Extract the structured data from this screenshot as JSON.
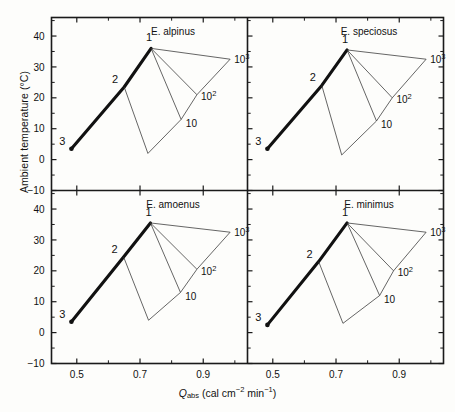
{
  "figure": {
    "axis": {
      "ylabel": "Ambient temperature (°C)",
      "xlabel_symbol": "Q",
      "xlabel_sub": "abs",
      "xlabel_units_pre": " (cal cm",
      "xlabel_units_sup1": "−2",
      "xlabel_units_mid": " min",
      "xlabel_units_sup2": "−1",
      "xlabel_units_post": ")",
      "xlabel_full": "Qabs (cal cm−2 min−1)",
      "yticks": [
        "40",
        "30",
        "20",
        "10",
        "0",
        "−10"
      ],
      "ytick_values": [
        40,
        30,
        20,
        10,
        0,
        -10
      ],
      "xticks": [
        "0.5",
        "0.7",
        "0.9"
      ],
      "xtick_values": [
        0.5,
        0.7,
        0.9
      ],
      "ylim": [
        -10,
        46
      ],
      "xlim": [
        0.42,
        1.04
      ],
      "grid": false
    },
    "panels": [
      {
        "key": "alpinus",
        "title": "E. alpinus"
      },
      {
        "key": "speciosus",
        "title": "E. speciosus"
      },
      {
        "key": "amoenus",
        "title": "E. amoenus"
      },
      {
        "key": "minimus",
        "title": "E. minimus"
      }
    ],
    "node_labels": {
      "one": "1",
      "two": "2",
      "three": "3"
    },
    "wind_labels": {
      "low": "10",
      "mid_base": "10",
      "mid_exp": "2",
      "high_base": "10",
      "high_exp": "3"
    },
    "colors": {
      "ink": "#111111",
      "frame": "#1a1a1a",
      "thin": "#333333",
      "background": "#fdfdfb"
    }
  },
  "chart_data": {
    "type": "line",
    "xlabel": "Qabs (cal cm−2 min−1)",
    "ylabel": "Ambient temperature (°C)",
    "xlim": [
      0.42,
      1.04
    ],
    "ylim": [
      -10,
      46
    ],
    "xticks": [
      0.5,
      0.7,
      0.9
    ],
    "yticks": [
      -10,
      0,
      10,
      20,
      30,
      40
    ],
    "grid": false,
    "legend": "none",
    "panel_layout": "2x2",
    "panels": [
      {
        "name": "E. alpinus",
        "series": [
          {
            "name": "metabolic-boundary",
            "style": "thick",
            "points": [
              {
                "x": 0.483,
                "y": 3.5,
                "label": "3"
              },
              {
                "x": 0.65,
                "y": 23.5,
                "label": "2"
              },
              {
                "x": 0.735,
                "y": 36.0,
                "label": "1"
              }
            ]
          },
          {
            "name": "fan-1-to-10cubed",
            "style": "thin",
            "points": [
              {
                "x": 0.735,
                "y": 36.0
              },
              {
                "x": 0.985,
                "y": 32.5
              }
            ]
          },
          {
            "name": "fan-1-to-10squared",
            "style": "thin",
            "points": [
              {
                "x": 0.735,
                "y": 36.0
              },
              {
                "x": 0.88,
                "y": 21.0
              }
            ]
          },
          {
            "name": "fan-1-to-10",
            "style": "thin",
            "points": [
              {
                "x": 0.735,
                "y": 36.0
              },
              {
                "x": 0.83,
                "y": 13.0
              }
            ]
          },
          {
            "name": "lower-boundary",
            "style": "thin",
            "points": [
              {
                "x": 0.65,
                "y": 23.5
              },
              {
                "x": 0.725,
                "y": 2.0
              },
              {
                "x": 0.83,
                "y": 13.0
              },
              {
                "x": 0.88,
                "y": 21.0
              },
              {
                "x": 0.985,
                "y": 32.5
              }
            ]
          }
        ],
        "annotations": [
          {
            "text": "10",
            "x": 0.845,
            "y": 12.0
          },
          {
            "text": "10^2",
            "x": 0.893,
            "y": 20.5
          },
          {
            "text": "10^3",
            "x": 0.998,
            "y": 32.5
          }
        ]
      },
      {
        "name": "E. speciosus",
        "series": [
          {
            "name": "metabolic-boundary",
            "style": "thick",
            "points": [
              {
                "x": 0.483,
                "y": 3.5,
                "label": "3"
              },
              {
                "x": 0.655,
                "y": 24.0,
                "label": "2"
              },
              {
                "x": 0.735,
                "y": 35.5,
                "label": "1"
              }
            ]
          },
          {
            "name": "fan-1-to-10cubed",
            "style": "thin",
            "points": [
              {
                "x": 0.735,
                "y": 35.5
              },
              {
                "x": 0.985,
                "y": 32.5
              }
            ]
          },
          {
            "name": "fan-1-to-10squared",
            "style": "thin",
            "points": [
              {
                "x": 0.735,
                "y": 35.5
              },
              {
                "x": 0.878,
                "y": 20.0
              }
            ]
          },
          {
            "name": "fan-1-to-10",
            "style": "thin",
            "points": [
              {
                "x": 0.735,
                "y": 35.5
              },
              {
                "x": 0.828,
                "y": 12.5
              }
            ]
          },
          {
            "name": "lower-boundary",
            "style": "thin",
            "points": [
              {
                "x": 0.655,
                "y": 24.0
              },
              {
                "x": 0.718,
                "y": 1.5
              },
              {
                "x": 0.828,
                "y": 12.5
              },
              {
                "x": 0.878,
                "y": 20.0
              },
              {
                "x": 0.985,
                "y": 32.5
              }
            ]
          }
        ],
        "annotations": [
          {
            "text": "10",
            "x": 0.842,
            "y": 11.5
          },
          {
            "text": "10^2",
            "x": 0.891,
            "y": 19.5
          },
          {
            "text": "10^3",
            "x": 0.998,
            "y": 32.5
          }
        ]
      },
      {
        "name": "E. amoenus",
        "series": [
          {
            "name": "metabolic-boundary",
            "style": "thick",
            "points": [
              {
                "x": 0.483,
                "y": 3.5,
                "label": "3"
              },
              {
                "x": 0.648,
                "y": 24.5,
                "label": "2"
              },
              {
                "x": 0.733,
                "y": 35.5,
                "label": "1"
              }
            ]
          },
          {
            "name": "fan-1-to-10cubed",
            "style": "thin",
            "points": [
              {
                "x": 0.733,
                "y": 35.5
              },
              {
                "x": 0.985,
                "y": 32.5
              }
            ]
          },
          {
            "name": "fan-1-to-10squared",
            "style": "thin",
            "points": [
              {
                "x": 0.733,
                "y": 35.5
              },
              {
                "x": 0.88,
                "y": 20.5
              }
            ]
          },
          {
            "name": "fan-1-to-10",
            "style": "thin",
            "points": [
              {
                "x": 0.733,
                "y": 35.5
              },
              {
                "x": 0.828,
                "y": 13.0
              }
            ]
          },
          {
            "name": "lower-boundary",
            "style": "thin",
            "points": [
              {
                "x": 0.648,
                "y": 24.5
              },
              {
                "x": 0.727,
                "y": 4.0
              },
              {
                "x": 0.828,
                "y": 13.0
              },
              {
                "x": 0.88,
                "y": 20.5
              },
              {
                "x": 0.985,
                "y": 32.5
              }
            ]
          }
        ],
        "annotations": [
          {
            "text": "10",
            "x": 0.843,
            "y": 12.0
          },
          {
            "text": "10^2",
            "x": 0.893,
            "y": 20.0
          },
          {
            "text": "10^3",
            "x": 0.998,
            "y": 32.5
          }
        ]
      },
      {
        "name": "E. minimus",
        "series": [
          {
            "name": "metabolic-boundary",
            "style": "thick",
            "points": [
              {
                "x": 0.483,
                "y": 2.5,
                "label": "3"
              },
              {
                "x": 0.645,
                "y": 23.0,
                "label": "2"
              },
              {
                "x": 0.735,
                "y": 35.5,
                "label": "1"
              }
            ]
          },
          {
            "name": "fan-1-to-10cubed",
            "style": "thin",
            "points": [
              {
                "x": 0.735,
                "y": 35.5
              },
              {
                "x": 0.985,
                "y": 32.5
              }
            ]
          },
          {
            "name": "fan-1-to-10squared",
            "style": "thin",
            "points": [
              {
                "x": 0.735,
                "y": 35.5
              },
              {
                "x": 0.882,
                "y": 20.0
              }
            ]
          },
          {
            "name": "fan-1-to-10",
            "style": "thin",
            "points": [
              {
                "x": 0.735,
                "y": 35.5
              },
              {
                "x": 0.838,
                "y": 12.0
              }
            ]
          },
          {
            "name": "lower-boundary",
            "style": "thin",
            "points": [
              {
                "x": 0.645,
                "y": 23.0
              },
              {
                "x": 0.722,
                "y": 3.0
              },
              {
                "x": 0.838,
                "y": 12.0
              },
              {
                "x": 0.882,
                "y": 20.0
              },
              {
                "x": 0.985,
                "y": 32.5
              }
            ]
          }
        ],
        "annotations": [
          {
            "text": "10",
            "x": 0.852,
            "y": 11.0
          },
          {
            "text": "10^2",
            "x": 0.895,
            "y": 19.5
          },
          {
            "text": "10^3",
            "x": 0.998,
            "y": 32.5
          }
        ]
      }
    ]
  }
}
